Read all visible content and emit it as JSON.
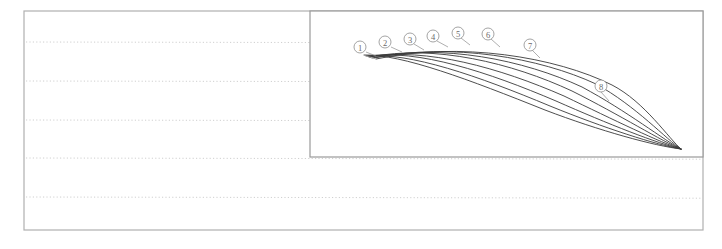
{
  "document": {
    "kind": "scanned-figure-page",
    "background_color": "#ffffff",
    "page_width": 722,
    "page_height": 249
  },
  "outer_frame": {
    "name": "page-border",
    "stroke_color": "#b0b0b0",
    "stroke_width": 1.2,
    "x": 24,
    "y": 11,
    "width": 679,
    "height": 219
  },
  "ruled_lines": {
    "name": "dotted-ruled-lines",
    "color": "#cfcfcf",
    "dash": "1.2 2.2",
    "stroke_width": 1,
    "count": 5,
    "y_positions": [
      42,
      81,
      120,
      158,
      197
    ]
  },
  "inner_panel": {
    "name": "figure-panel",
    "stroke_color": "#9a9a9a",
    "stroke_width": 1.2,
    "x": 310,
    "y": 11,
    "width": 393,
    "height": 146,
    "background": "#ffffff"
  },
  "chart_data": {
    "type": "line",
    "title": "",
    "subtitle": "",
    "xlabel": "",
    "ylabel": "",
    "grid": false,
    "legend_position": "inline-callouts",
    "annotations": [
      "1",
      "2",
      "3",
      "4",
      "5",
      "6",
      "7",
      "8"
    ],
    "curve_color": "#3a3a3a",
    "curve_width": 0.9,
    "convergence_point": {
      "x": 681,
      "y": 149
    },
    "series": [
      {
        "name": "1",
        "label": "1",
        "label_x": 360,
        "label_y": 47,
        "leader_from_x": 366,
        "leader_from_y": 52,
        "leader_to_x": 376,
        "leader_to_y": 56,
        "path": "M 364 55 C 402 54 470 80 545 110 C 600 131 655 146 681 149"
      },
      {
        "name": "2",
        "label": "2",
        "label_x": 385,
        "label_y": 42,
        "leader_from_x": 391,
        "leader_from_y": 47,
        "leader_to_x": 402,
        "leader_to_y": 52,
        "path": "M 366 56 C 410 52 478 76 550 106 C 604 128 657 145 681 149"
      },
      {
        "name": "3",
        "label": "3",
        "label_x": 410,
        "label_y": 39,
        "leader_from_x": 414,
        "leader_from_y": 44,
        "leader_to_x": 424,
        "leader_to_y": 50,
        "path": "M 368 56 C 418 49 488 72 556 101 C 608 124 659 144 681 149"
      },
      {
        "name": "4",
        "label": "4",
        "label_x": 433,
        "label_y": 36,
        "leader_from_x": 437,
        "leader_from_y": 41,
        "leader_to_x": 448,
        "leader_to_y": 47,
        "path": "M 369 57 C 426 47 500 68 564 96 C 614 120 661 143 681 149"
      },
      {
        "name": "5",
        "label": "5",
        "label_x": 458,
        "label_y": 33,
        "leader_from_x": 461,
        "leader_from_y": 38,
        "leader_to_x": 470,
        "leader_to_y": 45,
        "path": "M 370 57 C 434 44 512 63 572 91 C 620 115 663 142 681 149"
      },
      {
        "name": "6",
        "label": "6",
        "label_x": 488,
        "label_y": 34,
        "leader_from_x": 491,
        "leader_from_y": 39,
        "leader_to_x": 500,
        "leader_to_y": 47,
        "path": "M 372 58 C 442 43 524 60 582 87 C 627 111 665 141 681 149"
      },
      {
        "name": "7",
        "label": "7",
        "label_x": 530,
        "label_y": 45,
        "leader_from_x": 532,
        "leader_from_y": 50,
        "leader_to_x": 540,
        "leader_to_y": 58,
        "path": "M 374 58 C 452 42 540 58 596 84 C 636 106 667 140 681 149"
      },
      {
        "name": "8",
        "label": "8",
        "label_x": 601,
        "label_y": 86,
        "leader_from_x": 601,
        "leader_from_y": 92,
        "leader_to_x": 609,
        "leader_to_y": 101,
        "path": "M 376 59 C 460 41 556 57 612 85 C 645 102 669 139 681 149"
      }
    ]
  }
}
